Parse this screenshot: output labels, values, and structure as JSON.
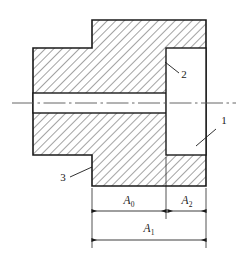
{
  "figure": {
    "type": "engineering-cross-section",
    "background_color": "#ffffff",
    "line_color": "#1a1a1a",
    "hatch_color": "#333333"
  },
  "callouts": [
    {
      "id": "callout-1",
      "label": "1",
      "x": 224,
      "y": 124,
      "leader_from_x": 216,
      "leader_from_y": 129,
      "leader_to_x": 196,
      "leader_to_y": 146
    },
    {
      "id": "callout-2",
      "label": "2",
      "x": 182,
      "y": 77,
      "leader_from_x": 179,
      "leader_from_y": 73,
      "leader_to_x": 165,
      "leader_to_y": 62
    },
    {
      "id": "callout-3",
      "label": "3",
      "x": 62,
      "y": 180,
      "leader_from_x": 70,
      "leader_from_y": 177,
      "leader_to_x": 92,
      "leader_to_y": 167
    }
  ],
  "dimensions": [
    {
      "id": "dim-a0",
      "base": "A",
      "subscript": "0",
      "label": "A0",
      "x1": 92,
      "x2": 166,
      "y": 211,
      "text_x": 129,
      "text_y": 203
    },
    {
      "id": "dim-a2",
      "base": "A",
      "subscript": "2",
      "label": "A2",
      "x1": 168,
      "x2": 206,
      "y": 211,
      "text_x": 187,
      "text_y": 203
    },
    {
      "id": "dim-a1",
      "base": "A",
      "subscript": "1",
      "label": "A1",
      "x1": 92,
      "x2": 206,
      "y": 240,
      "text_x": 149,
      "text_y": 231
    }
  ],
  "geometry": {
    "outline_points": "92,20 206,20 206,186 92,186 92,155 33,155 33,48 92,48",
    "bore": {
      "x": 33,
      "y": 93,
      "width": 133,
      "height": 20
    },
    "counterbore": {
      "x": 166,
      "y": 48,
      "width": 40,
      "height": 107
    },
    "centerline": {
      "x1": 12,
      "x2": 236,
      "y": 103
    },
    "extension_lines": [
      {
        "x": 92,
        "y1": 186,
        "y2": 248
      },
      {
        "x": 166,
        "y1": 155,
        "y2": 219
      },
      {
        "x": 206,
        "y1": 186,
        "y2": 248
      }
    ]
  }
}
